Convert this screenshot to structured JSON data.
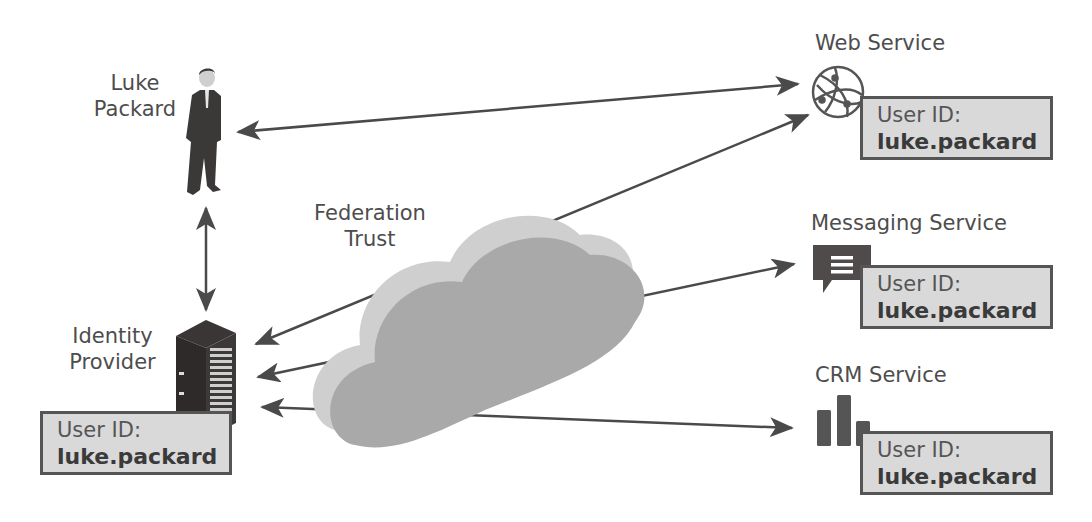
{
  "diagram": {
    "nodes": {
      "user": {
        "label_line1": "Luke",
        "label_line2": "Packard"
      },
      "identity_provider": {
        "label_line1": "Identity",
        "label_line2": "Provider",
        "user_id_key": "User ID:",
        "user_id_value": "luke.packard"
      },
      "federation": {
        "label_line1": "Federation",
        "label_line2": "Trust"
      },
      "web_service": {
        "label": "Web Service",
        "user_id_key": "User ID:",
        "user_id_value": "luke.packard"
      },
      "messaging_service": {
        "label": "Messaging Service",
        "user_id_key": "User ID:",
        "user_id_value": "luke.packard"
      },
      "crm_service": {
        "label": "CRM Service",
        "user_id_key": "User ID:",
        "user_id_value": "luke.packard"
      }
    },
    "icons": {
      "user": "person-icon",
      "identity_provider": "server-icon",
      "federation": "cloud-icon",
      "web_service": "globe-icon",
      "messaging_service": "chat-bubble-icon",
      "crm_service": "bar-chart-icon"
    },
    "edges": [
      {
        "from": "user",
        "to": "web_service",
        "type": "bidirectional"
      },
      {
        "from": "user",
        "to": "identity_provider",
        "type": "bidirectional"
      },
      {
        "from": "web_service",
        "to": "identity_provider",
        "type": "directed"
      },
      {
        "from": "messaging_service",
        "to": "identity_provider",
        "type": "directed"
      },
      {
        "from": "identity_provider",
        "to": "crm_service",
        "type": "bidirectional"
      }
    ],
    "colors": {
      "arrow": "#4a4a4a",
      "box_fill": "#d9d9d9",
      "box_border": "#555555",
      "cloud_face": "#a9a9a9",
      "cloud_side": "#cfcfcf",
      "text": "#4d4d4d"
    }
  }
}
